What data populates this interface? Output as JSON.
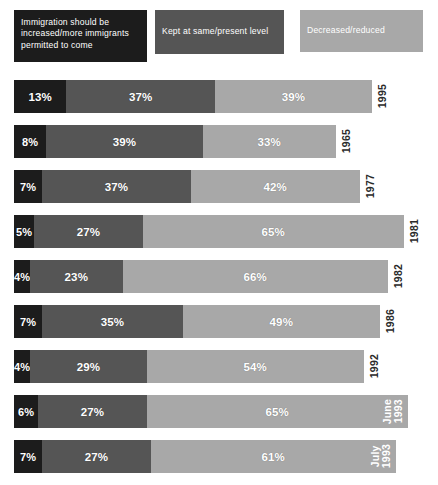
{
  "legend": {
    "items": [
      {
        "label": "Immigration should be\nincreased/more immigrants\npermitted to come",
        "color": "#1c1c1c",
        "key": "increased"
      },
      {
        "label": "Kept at same/present level",
        "color": "#555555",
        "key": "same"
      },
      {
        "label": "Decreased/reduced",
        "color": "#a8a8a8",
        "key": "decreased"
      }
    ]
  },
  "chart_data": {
    "type": "bar",
    "orientation": "horizontal",
    "stacked": true,
    "title": "",
    "xlabel": "",
    "ylabel": "",
    "xlim": [
      0,
      100
    ],
    "grid": false,
    "legend_position": "top",
    "value_suffix": "%",
    "categories": [
      "1995",
      "1965",
      "1977",
      "1981",
      "1982",
      "1986",
      "1992",
      "June\n1993",
      "July\n1993"
    ],
    "series": [
      {
        "name": "Immigration should be increased/more immigrants permitted to come",
        "color": "#1c1c1c",
        "values": [
          13,
          8,
          7,
          5,
          4,
          7,
          4,
          6,
          7
        ]
      },
      {
        "name": "Kept at same/present level",
        "color": "#555555",
        "values": [
          37,
          39,
          37,
          27,
          23,
          35,
          29,
          27,
          27
        ]
      },
      {
        "name": "Decreased/reduced",
        "color": "#a8a8a8",
        "values": [
          39,
          33,
          42,
          65,
          66,
          49,
          54,
          65,
          61
        ]
      }
    ],
    "rows": [
      {
        "year": "1995",
        "year_display": "1995",
        "label_inside": false,
        "values": [
          13,
          37,
          39
        ],
        "labels": [
          "13%",
          "37%",
          "39%"
        ],
        "total": 89
      },
      {
        "year": "1965",
        "year_display": "1965",
        "label_inside": false,
        "values": [
          8,
          39,
          33
        ],
        "labels": [
          "8%",
          "39%",
          "33%"
        ],
        "total": 80
      },
      {
        "year": "1977",
        "year_display": "1977",
        "label_inside": false,
        "values": [
          7,
          37,
          42
        ],
        "labels": [
          "7%",
          "37%",
          "42%"
        ],
        "total": 86
      },
      {
        "year": "1981",
        "year_display": "1981",
        "label_inside": false,
        "values": [
          5,
          27,
          65
        ],
        "labels": [
          "5%",
          "27%",
          "65%"
        ],
        "total": 97
      },
      {
        "year": "1982",
        "year_display": "1982",
        "label_inside": false,
        "values": [
          4,
          23,
          66
        ],
        "labels": [
          "4%",
          "23%",
          "66%"
        ],
        "total": 93
      },
      {
        "year": "1986",
        "year_display": "1986",
        "label_inside": false,
        "values": [
          7,
          35,
          49
        ],
        "labels": [
          "7%",
          "35%",
          "49%"
        ],
        "total": 91
      },
      {
        "year": "1992",
        "year_display": "1992",
        "label_inside": false,
        "values": [
          4,
          29,
          54
        ],
        "labels": [
          "4%",
          "29%",
          "54%"
        ],
        "total": 87
      },
      {
        "year": "June 1993",
        "year_display": "June\n1993",
        "label_inside": true,
        "values": [
          6,
          27,
          65
        ],
        "labels": [
          "6%",
          "27%",
          "65%"
        ],
        "total": 98
      },
      {
        "year": "July 1993",
        "year_display": "July\n1993",
        "label_inside": true,
        "values": [
          7,
          27,
          61
        ],
        "labels": [
          "7%",
          "27%",
          "61%"
        ],
        "total": 95
      }
    ]
  }
}
